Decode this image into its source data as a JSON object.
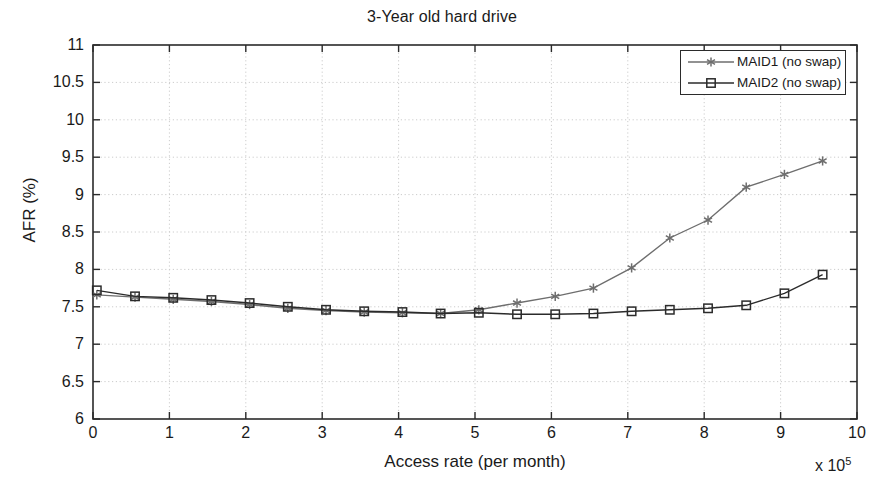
{
  "chart_data": {
    "type": "line",
    "title": "3-Year old hard drive",
    "xlabel": "Access rate (per month)",
    "ylabel": "AFR (%)",
    "x_multiplier": "x 10",
    "x_multiplier_exp": "5",
    "xlim": [
      0,
      10
    ],
    "ylim": [
      6,
      11
    ],
    "xticks": [
      "0",
      "1",
      "2",
      "3",
      "4",
      "5",
      "6",
      "7",
      "8",
      "9",
      "10"
    ],
    "yticks": [
      "6",
      "6.5",
      "7",
      "7.5",
      "8",
      "8.5",
      "9",
      "9.5",
      "10",
      "10.5",
      "11"
    ],
    "grid": true,
    "legend_position": "top-right",
    "x": [
      0.05,
      0.55,
      1.05,
      1.55,
      2.05,
      2.55,
      3.05,
      3.55,
      4.05,
      4.55,
      5.05,
      5.55,
      6.05,
      6.55,
      7.05,
      7.55,
      8.05,
      8.55,
      9.05,
      9.55
    ],
    "series": [
      {
        "name": "MAID1 (no swap)",
        "marker": "asterisk",
        "color": "#6e6e6e",
        "values": [
          7.66,
          7.63,
          7.6,
          7.57,
          7.53,
          7.48,
          7.45,
          7.43,
          7.42,
          7.41,
          7.46,
          7.55,
          7.64,
          7.75,
          8.02,
          8.42,
          8.66,
          9.1,
          9.27,
          9.45
        ]
      },
      {
        "name": "MAID2 (no swap)",
        "marker": "square",
        "color": "#2b2b2b",
        "values": [
          7.72,
          7.64,
          7.62,
          7.59,
          7.55,
          7.5,
          7.46,
          7.44,
          7.43,
          7.41,
          7.42,
          7.4,
          7.4,
          7.41,
          7.44,
          7.46,
          7.48,
          7.52,
          7.68,
          7.93
        ]
      }
    ]
  }
}
